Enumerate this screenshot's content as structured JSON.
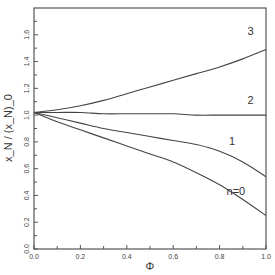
{
  "chart_data": {
    "type": "line",
    "title": "",
    "xlabel": "Φ",
    "ylabel": "x_N / (x_N)_0",
    "xlim": [
      0.0,
      1.0
    ],
    "ylim": [
      0.0,
      1.8
    ],
    "grid": false,
    "legend": "none (curves labeled inline)",
    "x_ticks": [
      "0.0",
      "0.2",
      "0.4",
      "0.6",
      "0.8",
      "1.0"
    ],
    "y_ticks": [
      "0.0",
      "0.2",
      "0.4",
      "0.6",
      "0.8",
      "1.0",
      "1.2",
      "1.4",
      "1.6"
    ],
    "x": [
      0.0,
      0.1,
      0.2,
      0.3,
      0.4,
      0.5,
      0.6,
      0.7,
      0.8,
      0.9,
      1.0
    ],
    "series": [
      {
        "name": "3",
        "label": "3",
        "values": [
          1.02,
          1.04,
          1.07,
          1.11,
          1.16,
          1.21,
          1.26,
          1.31,
          1.36,
          1.42,
          1.49
        ]
      },
      {
        "name": "2",
        "label": "2",
        "values": [
          1.02,
          1.02,
          1.02,
          1.01,
          1.01,
          1.01,
          1.01,
          1.0,
          1.0,
          1.0,
          1.0
        ]
      },
      {
        "name": "1",
        "label": "1",
        "values": [
          1.02,
          0.98,
          0.94,
          0.9,
          0.87,
          0.84,
          0.81,
          0.78,
          0.73,
          0.65,
          0.54
        ]
      },
      {
        "name": "n=0",
        "label": "n=0",
        "values": [
          1.02,
          0.95,
          0.89,
          0.83,
          0.77,
          0.71,
          0.65,
          0.57,
          0.48,
          0.37,
          0.25
        ]
      }
    ],
    "annotations": [
      {
        "text": "3",
        "x": 0.92,
        "y": 1.6
      },
      {
        "text": "2",
        "x": 0.92,
        "y": 1.08
      },
      {
        "text": "1",
        "x": 0.84,
        "y": 0.78
      },
      {
        "text": "n=0",
        "x": 0.83,
        "y": 0.4
      }
    ]
  },
  "axes": {
    "xlabel": "Φ",
    "ylabel_main": "x",
    "ylabel_sub": "N",
    "ylabel_full": "x_N / (x_N)_0"
  }
}
